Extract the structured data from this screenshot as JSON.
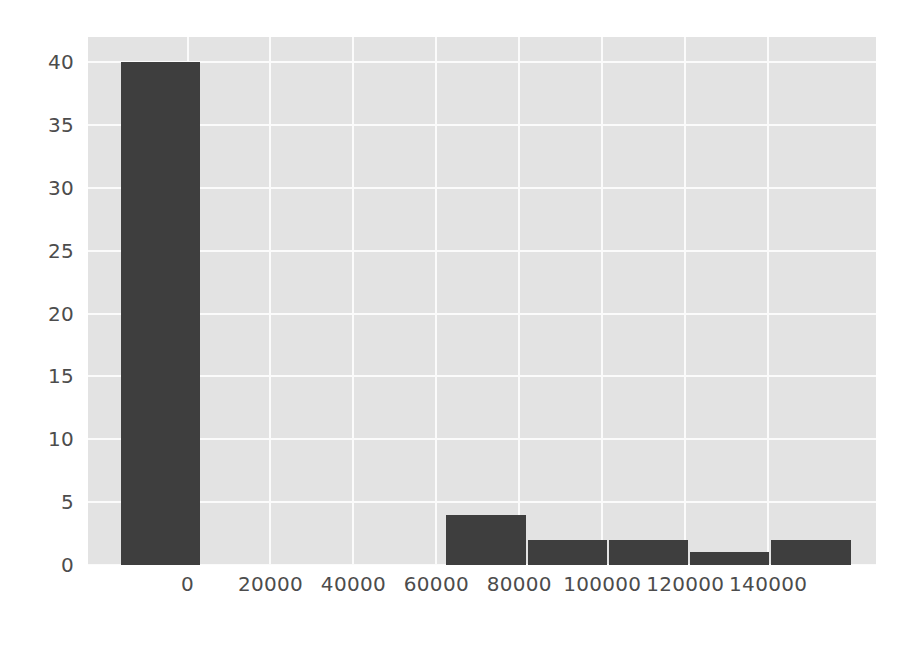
{
  "chart_data": {
    "type": "bar",
    "subtype": "histogram",
    "title": "",
    "subtitle": "",
    "xlabel": "",
    "ylabel": "",
    "categories": [
      "-16000 to 3600",
      "3600 to 23200",
      "23200 to 42800",
      "42800 to 62400",
      "62400 to 82000",
      "82000 to 101600",
      "101600 to 121200",
      "121200 to 140800",
      "140800 to 160400"
    ],
    "bin_edges": [
      -16000,
      3600,
      23200,
      42800,
      62400,
      82000,
      101600,
      121200,
      140800,
      160400
    ],
    "values": [
      40,
      0,
      0,
      0,
      4,
      2,
      2,
      1,
      2
    ],
    "bar_color": "#3e3e3e",
    "plot_background": "#e3e3e3",
    "grid_color": "#fbfbfb",
    "grid": true,
    "legend": false,
    "legend_position": "none",
    "xlim": [
      -24000,
      166000
    ],
    "ylim": [
      0,
      42
    ],
    "xticks": [
      0,
      20000,
      40000,
      60000,
      80000,
      100000,
      120000,
      140000
    ],
    "xtick_labels": [
      "0",
      "20000",
      "40000",
      "60000",
      "80000",
      "100000",
      "120000",
      "140000"
    ],
    "yticks": [
      0,
      5,
      10,
      15,
      20,
      25,
      30,
      35,
      40
    ],
    "ytick_labels": [
      "0",
      "5",
      "10",
      "15",
      "20",
      "25",
      "30",
      "35",
      "40"
    ]
  }
}
